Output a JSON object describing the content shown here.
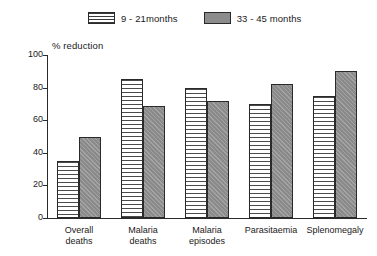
{
  "chart_data": {
    "type": "bar",
    "title": "",
    "subtitle": "",
    "xlabel": "",
    "ylabel": "% reduction",
    "ylim": [
      0,
      100
    ],
    "yticks": [
      0,
      20,
      40,
      60,
      80,
      100
    ],
    "grid": false,
    "legend_position": "top-center",
    "categories": [
      "Overall deaths",
      "Malaria deaths",
      "Malaria episodes",
      "Parasitaemia",
      "Splenomegaly"
    ],
    "category_lines": [
      [
        "Overall",
        "deaths"
      ],
      [
        "Malaria",
        "deaths"
      ],
      [
        "Malaria",
        "episodes"
      ],
      [
        "Parasitaemia",
        ""
      ],
      [
        "Splenomegaly",
        ""
      ]
    ],
    "series": [
      {
        "name": "9 - 21months",
        "pattern": "horizontal-stripes",
        "color": "#ffffff",
        "values": [
          35,
          85,
          80,
          70,
          75
        ]
      },
      {
        "name": "33 - 45 months",
        "pattern": "solid-gray",
        "color": "#8a8a8a",
        "values": [
          50,
          69,
          72,
          82,
          90
        ]
      }
    ]
  },
  "legend": {
    "entries": [
      {
        "label": "9 - 21months"
      },
      {
        "label": "33 - 45 months"
      }
    ]
  },
  "axis": {
    "y_title": "% reduction",
    "y_ticks": [
      "100",
      "80",
      "60",
      "40",
      "20",
      "0"
    ]
  }
}
